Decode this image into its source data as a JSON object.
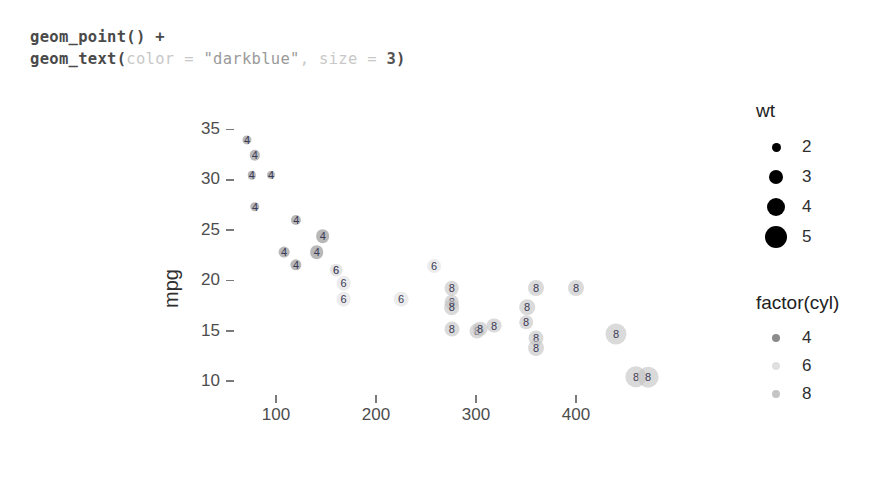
{
  "code": {
    "line1_fn": "geom_point()",
    "line1_op": " +",
    "line2_fn": "geom_text(",
    "line2_arg": "color",
    "line2_eq": " = ",
    "line2_str": "\"darkblue\"",
    "line2_comma": ", ",
    "line2_arg2": "size",
    "line2_eq2": " = ",
    "line2_num": "3",
    "line2_close": ")"
  },
  "legends": {
    "size": {
      "title": "wt",
      "items": [
        {
          "label": "2",
          "dot_px": 9
        },
        {
          "label": "3",
          "dot_px": 14
        },
        {
          "label": "4",
          "dot_px": 18
        },
        {
          "label": "5",
          "dot_px": 22
        }
      ],
      "color": "#000000"
    },
    "color": {
      "title": "factor(cyl)",
      "items": [
        {
          "label": "4",
          "color": "#8c8c8c"
        },
        {
          "label": "6",
          "color": "#e0e0e0"
        },
        {
          "label": "8",
          "color": "#c4c4c4"
        }
      ],
      "dot_px": 8
    }
  },
  "chart_data": {
    "type": "scatter",
    "title": "",
    "xlabel": "disp",
    "ylabel": "mpg",
    "xlim": [
      60,
      480
    ],
    "ylim": [
      9,
      36
    ],
    "xticks": [
      100,
      200,
      300,
      400
    ],
    "yticks": [
      10,
      15,
      20,
      25,
      30,
      35
    ],
    "grid": false,
    "legend_position": "right",
    "size_aes": "wt",
    "color_aes": "factor(cyl)",
    "text_aes": "cyl",
    "series": [
      {
        "name": "mtcars",
        "points": [
          {
            "disp": 71.1,
            "mpg": 33.9,
            "wt": 1.835,
            "cyl": 4,
            "label": "4"
          },
          {
            "disp": 78.7,
            "mpg": 32.4,
            "wt": 2.2,
            "cyl": 4,
            "label": "4"
          },
          {
            "disp": 75.7,
            "mpg": 30.4,
            "wt": 1.615,
            "cyl": 4,
            "label": "4"
          },
          {
            "disp": 95.1,
            "mpg": 30.4,
            "wt": 1.513,
            "cyl": 4,
            "label": "4"
          },
          {
            "disp": 79.0,
            "mpg": 27.3,
            "wt": 1.935,
            "cyl": 4,
            "label": "4"
          },
          {
            "disp": 120.3,
            "mpg": 26.0,
            "wt": 2.14,
            "cyl": 4,
            "label": "4"
          },
          {
            "disp": 146.7,
            "mpg": 24.4,
            "wt": 3.19,
            "cyl": 4,
            "label": "4"
          },
          {
            "disp": 140.8,
            "mpg": 22.8,
            "wt": 3.15,
            "cyl": 4,
            "label": "4"
          },
          {
            "disp": 108.0,
            "mpg": 22.8,
            "wt": 2.32,
            "cyl": 4,
            "label": "4"
          },
          {
            "disp": 120.1,
            "mpg": 21.5,
            "wt": 2.465,
            "cyl": 4,
            "label": "4"
          },
          {
            "disp": 160.0,
            "mpg": 21.0,
            "wt": 2.62,
            "cyl": 6,
            "label": "6"
          },
          {
            "disp": 160.0,
            "mpg": 21.0,
            "wt": 2.875,
            "cyl": 6,
            "label": "6"
          },
          {
            "disp": 167.6,
            "mpg": 19.7,
            "wt": 3.44,
            "cyl": 6,
            "label": "6"
          },
          {
            "disp": 167.6,
            "mpg": 18.1,
            "wt": 3.46,
            "cyl": 6,
            "label": "6"
          },
          {
            "disp": 225.0,
            "mpg": 18.1,
            "wt": 3.46,
            "cyl": 6,
            "label": "6"
          },
          {
            "disp": 258.0,
            "mpg": 21.4,
            "wt": 3.215,
            "cyl": 6,
            "label": "6"
          },
          {
            "disp": 275.8,
            "mpg": 19.2,
            "wt": 3.44,
            "cyl": 8,
            "label": "8"
          },
          {
            "disp": 275.8,
            "mpg": 17.8,
            "wt": 3.44,
            "cyl": 8,
            "label": "8"
          },
          {
            "disp": 275.8,
            "mpg": 17.3,
            "wt": 3.73,
            "cyl": 8,
            "label": "8"
          },
          {
            "disp": 275.8,
            "mpg": 15.2,
            "wt": 3.57,
            "cyl": 8,
            "label": "8"
          },
          {
            "disp": 301.0,
            "mpg": 15.0,
            "wt": 3.57,
            "cyl": 8,
            "label": "8"
          },
          {
            "disp": 304.0,
            "mpg": 15.2,
            "wt": 3.435,
            "cyl": 8,
            "label": "8"
          },
          {
            "disp": 318.0,
            "mpg": 15.5,
            "wt": 3.52,
            "cyl": 8,
            "label": "8"
          },
          {
            "disp": 350.0,
            "mpg": 15.8,
            "wt": 3.17,
            "cyl": 8,
            "label": "8"
          },
          {
            "disp": 351.0,
            "mpg": 17.3,
            "wt": 3.73,
            "cyl": 8,
            "label": "8"
          },
          {
            "disp": 360.0,
            "mpg": 14.3,
            "wt": 3.57,
            "cyl": 8,
            "label": "8"
          },
          {
            "disp": 360.0,
            "mpg": 13.3,
            "wt": 3.84,
            "cyl": 8,
            "label": "8"
          },
          {
            "disp": 360.0,
            "mpg": 19.2,
            "wt": 3.845,
            "cyl": 8,
            "label": "8"
          },
          {
            "disp": 400.0,
            "mpg": 19.2,
            "wt": 3.845,
            "cyl": 8,
            "label": "8"
          },
          {
            "disp": 440.0,
            "mpg": 14.7,
            "wt": 5.345,
            "cyl": 8,
            "label": "8"
          },
          {
            "disp": 460.0,
            "mpg": 10.4,
            "wt": 5.424,
            "cyl": 8,
            "label": "8"
          },
          {
            "disp": 472.0,
            "mpg": 10.4,
            "wt": 5.25,
            "cyl": 8,
            "label": "8"
          }
        ]
      }
    ]
  }
}
